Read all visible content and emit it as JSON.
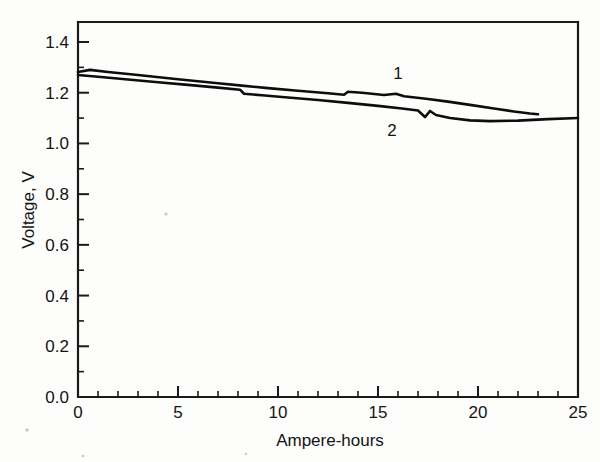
{
  "chart_data": {
    "type": "line",
    "title": "",
    "xlabel": "Ampere-hours",
    "ylabel": "Voltage, V",
    "xlim": [
      0,
      25
    ],
    "ylim": [
      0.0,
      1.5
    ],
    "grid": false,
    "legend_position": "inline-curve-labels",
    "x_ticks_major": [
      0,
      5,
      10,
      15,
      20,
      25
    ],
    "x_tick_labels": [
      "0",
      "5",
      "10",
      "15",
      "20",
      "25"
    ],
    "x_tick_minor_step": 1,
    "y_ticks_major": [
      0.0,
      0.2,
      0.4,
      0.6,
      0.8,
      1.0,
      1.2,
      1.4
    ],
    "y_tick_labels": [
      "0.0",
      "0.2",
      "0.4",
      "0.6",
      "0.8",
      "1.0",
      "1.2",
      "1.4"
    ],
    "y_tick_minor_step": 0.1,
    "series": [
      {
        "name": "1",
        "label": "1",
        "label_x": 16.0,
        "label_y": 1.255,
        "color": "#0d0d0d",
        "points": [
          [
            0.0,
            1.282
          ],
          [
            0.6,
            1.29
          ],
          [
            1.5,
            1.282
          ],
          [
            3.0,
            1.27
          ],
          [
            5.0,
            1.253
          ],
          [
            7.0,
            1.237
          ],
          [
            8.2,
            1.228
          ],
          [
            9.5,
            1.218
          ],
          [
            11.0,
            1.208
          ],
          [
            12.5,
            1.198
          ],
          [
            13.3,
            1.192
          ],
          [
            13.5,
            1.204
          ],
          [
            14.2,
            1.2
          ],
          [
            15.3,
            1.191
          ],
          [
            15.9,
            1.196
          ],
          [
            16.3,
            1.186
          ],
          [
            17.4,
            1.176
          ],
          [
            18.5,
            1.165
          ],
          [
            19.6,
            1.152
          ],
          [
            20.8,
            1.138
          ],
          [
            21.8,
            1.126
          ],
          [
            22.6,
            1.118
          ],
          [
            23.0,
            1.115
          ]
        ]
      },
      {
        "name": "2",
        "label": "2",
        "label_x": 15.7,
        "label_y": 1.03,
        "color": "#0d0d0d",
        "points": [
          [
            0.0,
            1.27
          ],
          [
            1.0,
            1.263
          ],
          [
            2.5,
            1.252
          ],
          [
            4.0,
            1.241
          ],
          [
            5.5,
            1.231
          ],
          [
            7.0,
            1.22
          ],
          [
            8.1,
            1.212
          ],
          [
            8.3,
            1.196
          ],
          [
            9.2,
            1.19
          ],
          [
            10.5,
            1.181
          ],
          [
            12.0,
            1.171
          ],
          [
            13.5,
            1.16
          ],
          [
            15.0,
            1.148
          ],
          [
            16.2,
            1.138
          ],
          [
            17.0,
            1.13
          ],
          [
            17.35,
            1.104
          ],
          [
            17.6,
            1.128
          ],
          [
            17.9,
            1.112
          ],
          [
            18.6,
            1.1
          ],
          [
            19.6,
            1.091
          ],
          [
            20.6,
            1.088
          ],
          [
            22.0,
            1.09
          ],
          [
            23.5,
            1.096
          ],
          [
            25.0,
            1.1
          ]
        ]
      }
    ]
  },
  "figure": {
    "axis_label_x": "Ampere-hours",
    "axis_label_y": "Voltage, V"
  }
}
